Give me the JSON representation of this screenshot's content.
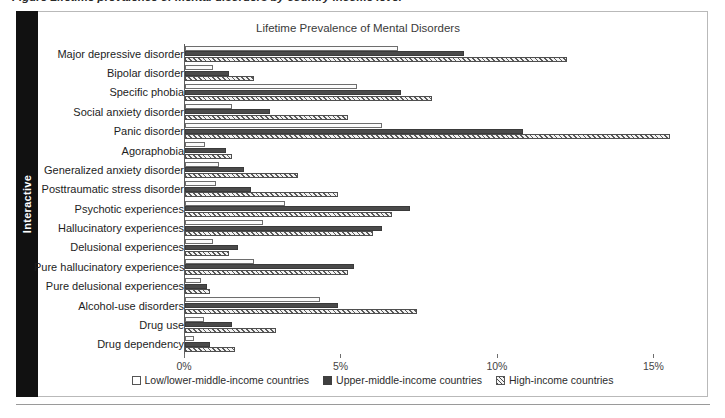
{
  "caption": {
    "text": "Figure  Lifetime prevalence of mental disorders by country income level"
  },
  "sidebar": {
    "tab_label": "Interactive"
  },
  "legend": {
    "position": "bottom-center",
    "items": [
      {
        "label": "Low/lower-middle-income countries",
        "swatch": "low"
      },
      {
        "label": "Upper-middle-income countries",
        "swatch": "upper"
      },
      {
        "label": "High-income countries",
        "swatch": "high"
      }
    ]
  },
  "chart_data": {
    "type": "bar",
    "orientation": "horizontal",
    "title": "Lifetime Prevalence of Mental Disorders",
    "xlabel": "",
    "ylabel": "",
    "xlim": [
      0,
      16.2
    ],
    "grid": false,
    "legend_position": "bottom-center",
    "tick_values": [
      0,
      5,
      10,
      15
    ],
    "tick_labels": [
      "0%",
      "5%",
      "10%",
      "15%"
    ],
    "categories": [
      "Major depressive disorder",
      "Bipolar disorder",
      "Specific phobia",
      "Social anxiety disorder",
      "Panic disorder",
      "Agoraphobia",
      "Generalized anxiety disorder",
      "Posttraumatic stress disorder",
      "Psychotic experiences",
      "Hallucinatory experiences",
      "Delusional experiences",
      "Pure hallucinatory experiences",
      "Pure delusional experiences",
      "Alcohol-use disorders",
      "Drug use",
      "Drug dependency"
    ],
    "series": [
      {
        "name": "Low/lower-middle-income countries",
        "style": "low",
        "values": [
          6.8,
          0.9,
          5.5,
          1.5,
          6.3,
          0.65,
          1.1,
          1.0,
          3.2,
          2.5,
          0.9,
          2.2,
          0.5,
          4.3,
          0.6,
          0.3
        ]
      },
      {
        "name": "Upper-middle-income countries",
        "style": "upper",
        "values": [
          8.9,
          1.4,
          6.9,
          2.7,
          10.8,
          1.3,
          1.9,
          2.1,
          7.2,
          6.3,
          1.7,
          5.4,
          0.7,
          4.9,
          1.5,
          0.8
        ]
      },
      {
        "name": "High-income countries",
        "style": "high",
        "values": [
          12.2,
          2.2,
          7.9,
          5.2,
          15.5,
          1.5,
          3.6,
          4.9,
          6.6,
          6.0,
          1.4,
          5.2,
          0.8,
          7.4,
          2.9,
          1.6
        ]
      }
    ]
  }
}
